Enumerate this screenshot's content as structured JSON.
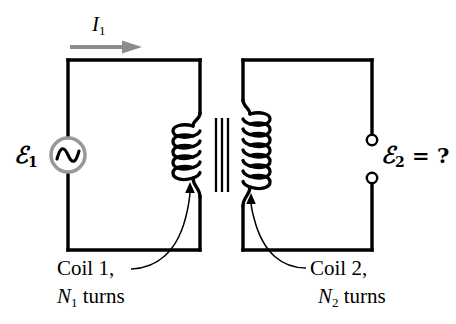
{
  "figure": {
    "type": "transformer-circuit-diagram",
    "background_color": "#ffffff",
    "wire_color": "#000000",
    "accent_gray": "#999999"
  },
  "labels": {
    "emf1": {
      "symbol": "ℰ",
      "subscript": "1",
      "suffix": ""
    },
    "emf2": {
      "symbol": "ℰ",
      "subscript": "2",
      "suffix": " = ?"
    },
    "current": {
      "symbol": "I",
      "subscript": "1"
    },
    "coil1": {
      "name": "Coil 1,",
      "turns_symbol": "N",
      "turns_subscript": "1",
      "turns_word": " turns"
    },
    "coil2": {
      "name": "Coil 2,",
      "turns_symbol": "N",
      "turns_subscript": "2",
      "turns_word": " turns"
    }
  },
  "components": {
    "ac_source": {
      "name": "ac-source",
      "circle_color": "#999999",
      "wave_color": "#000000"
    },
    "current_arrow": {
      "name": "current-arrow",
      "color": "#8c8c8c",
      "direction": "right"
    },
    "core": {
      "name": "transformer-core",
      "line_count": 3,
      "color": "#000000"
    },
    "primary_coil": {
      "name": "primary-coil",
      "loops": 4
    },
    "secondary_coil": {
      "name": "secondary-coil",
      "loops": 6
    },
    "terminals": {
      "name": "output-terminals",
      "count": 2,
      "style": "open-circle"
    },
    "leader_left": {
      "name": "leader-line-coil1"
    },
    "leader_right": {
      "name": "leader-line-coil2"
    }
  }
}
